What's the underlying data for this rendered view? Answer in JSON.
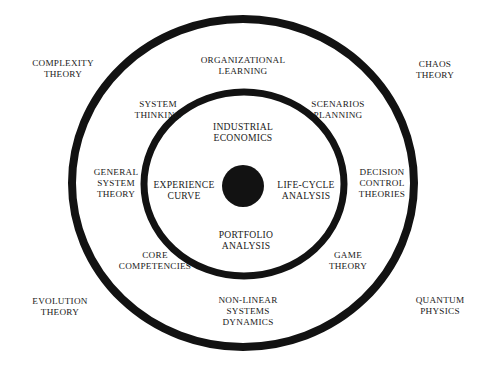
{
  "figure": {
    "type": "concentric-circles-diagram",
    "background_color": "#ffffff",
    "stroke_color": "#121212",
    "text_color": "#1a1a1a",
    "core": {
      "name": "core-dot",
      "fill": "#121212"
    },
    "rings": [
      {
        "name": "outer-ring",
        "cx": 243,
        "cy": 183,
        "rx": 171,
        "ry": 164,
        "stroke_width": 8
      },
      {
        "name": "middle-ring",
        "cx": 244,
        "cy": 184,
        "rx": 100,
        "ry": 92,
        "stroke_width": 7
      },
      {
        "name": "core-dot",
        "cx": 243,
        "cy": 186,
        "rx": 21,
        "ry": 21,
        "stroke_width": 0
      }
    ],
    "labels": {
      "outside": [
        {
          "id": "complexity-theory",
          "text": "Complexity\nTheory",
          "x": 63,
          "y": 69
        },
        {
          "id": "chaos-theory",
          "text": "Chaos\nTheory",
          "x": 435,
          "y": 70
        },
        {
          "id": "evolution-theory",
          "text": "Evolution\nTheory",
          "x": 60,
          "y": 307
        },
        {
          "id": "quantum-physics",
          "text": "Quantum\nPhysics",
          "x": 440,
          "y": 306
        }
      ],
      "middle_band": [
        {
          "id": "organizational-learning",
          "text": "Organizational\nLearning",
          "x": 243,
          "y": 66
        },
        {
          "id": "system-thinking",
          "text": "System\nThinking",
          "x": 158,
          "y": 110
        },
        {
          "id": "scenarios-planning",
          "text": "Scenarios\nPlanning",
          "x": 338,
          "y": 110
        },
        {
          "id": "general-system-theory",
          "text": "General\nSystem\nTheory",
          "x": 116,
          "y": 183
        },
        {
          "id": "decision-control-theories",
          "text": "Decision\nControl\nTheories",
          "x": 382,
          "y": 183
        },
        {
          "id": "core-competencies",
          "text": "Core\nCompetencies",
          "x": 155,
          "y": 261
        },
        {
          "id": "game-theory",
          "text": "Game\nTheory",
          "x": 348,
          "y": 261
        },
        {
          "id": "non-linear-systems-dynamics",
          "text": "Non-Linear\nSystems\nDynamics",
          "x": 248,
          "y": 311
        }
      ],
      "inner_band": [
        {
          "id": "industrial-economics",
          "text": "Industrial\nEconomics",
          "x": 243,
          "y": 132
        },
        {
          "id": "experience-curve",
          "text": "Experience\nCurve",
          "x": 184,
          "y": 190
        },
        {
          "id": "life-cycle-analysis",
          "text": "Life-Cycle\nAnalysis",
          "x": 306,
          "y": 190
        },
        {
          "id": "portfolio-analysis",
          "text": "Portfolio\nAnalysis",
          "x": 246,
          "y": 240
        }
      ]
    }
  }
}
